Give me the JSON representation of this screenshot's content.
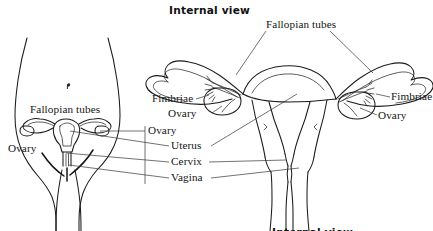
{
  "figure": {
    "title_top": "Internal view",
    "title_bottom": "Internal view"
  },
  "labels": {
    "left_figure": {
      "fallopian_tubes": "Fallopian tubes",
      "ovary": "Ovary"
    },
    "center": {
      "ovary": "Ovary",
      "uterus": "Uterus",
      "cervix": "Cervix",
      "vagina": "Vagina"
    },
    "right_figure": {
      "fallopian_tubes": "Fallopian tubes",
      "fimbriae_left": "Fimbriae",
      "ovary_left": "Ovary",
      "fimbriae_right": "Fimbriae",
      "ovary_right": "Ovary"
    }
  },
  "colors": {
    "ink": "#1b1b1b",
    "leader": "#3a3a3a",
    "background": "#ffffff",
    "text": "#151515"
  }
}
